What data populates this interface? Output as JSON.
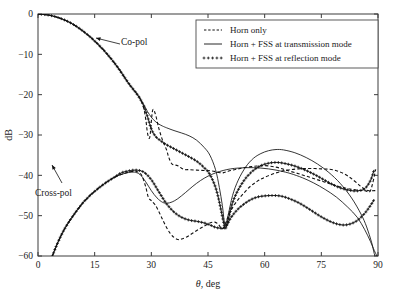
{
  "chart_data": {
    "type": "line",
    "title": "",
    "xlabel": "θ, deg",
    "ylabel": "dB",
    "xlim": [
      0,
      90
    ],
    "ylim": [
      -60,
      0
    ],
    "xticks": [
      0,
      15,
      30,
      45,
      60,
      75,
      90
    ],
    "yticks": [
      0,
      -10,
      -20,
      -30,
      -40,
      -50,
      -60
    ],
    "grid": false,
    "legend_position": "top-right",
    "legend": [
      {
        "label": "Horn only",
        "style": "dashed"
      },
      {
        "label": "Horn + FSS at transmission mode",
        "style": "solid"
      },
      {
        "label": "Horn + FSS at reflection mode",
        "style": "plus-markers"
      }
    ],
    "annotations": [
      {
        "text": "Co-pol",
        "x": 26,
        "y": -6
      },
      {
        "text": "Cross-pol",
        "x": 18,
        "y": -52
      }
    ],
    "series": [
      {
        "name": "Co-pol, Horn only",
        "style": "dashed",
        "x": [
          0,
          3,
          6,
          9,
          12,
          15,
          18,
          21,
          24,
          26,
          27,
          28,
          28.6,
          29,
          29.6,
          30.3,
          31,
          32,
          33,
          34,
          34.6,
          35.5,
          37,
          38.5,
          40,
          42,
          44,
          46,
          47.5,
          48.6,
          49.3,
          50,
          51,
          52.5,
          54,
          56,
          58,
          60,
          62,
          64,
          66,
          69,
          72,
          75,
          78,
          81,
          84,
          86.5,
          88,
          89.4
        ],
        "y": [
          0,
          -0.3,
          -1.1,
          -2.4,
          -4.3,
          -6.7,
          -9.6,
          -13.1,
          -17.2,
          -19.6,
          -20.9,
          -23.4,
          -26.6,
          -29.6,
          -30.5,
          -24.1,
          -24.6,
          -28.4,
          -31.4,
          -33.6,
          -35.5,
          -37.2,
          -37.6,
          -38.5,
          -38.6,
          -38.7,
          -38.8,
          -38.9,
          -39.2,
          -39.4,
          -39.3,
          -39.1,
          -38.8,
          -38.5,
          -38.2,
          -37.9,
          -37.7,
          -37.6,
          -37.8,
          -38.2,
          -38.8,
          -39.6,
          -40.5,
          -41.4,
          -42.3,
          -43.1,
          -43.6,
          -43.8,
          -43.8,
          -38.5
        ]
      },
      {
        "name": "Co-pol, Horn + FSS at transmission mode",
        "style": "solid",
        "x": [
          0,
          3,
          6,
          9,
          12,
          15,
          18,
          21,
          24,
          26,
          27,
          28,
          29,
          30,
          31,
          32,
          33,
          34,
          36,
          38,
          40,
          42,
          44,
          45.5,
          47,
          48,
          48.8,
          49.5,
          50.3,
          51.5,
          53,
          55,
          57,
          59,
          61,
          63,
          65,
          68,
          71,
          74,
          77,
          80,
          83,
          85.5,
          87,
          88.3,
          89.2,
          89.8
        ],
        "y": [
          0,
          -0.3,
          -1.1,
          -2.4,
          -4.3,
          -6.7,
          -9.6,
          -13.1,
          -17.2,
          -19.6,
          -21.0,
          -22.5,
          -24.2,
          -25.6,
          -26.6,
          -27.3,
          -27.8,
          -28.2,
          -28.9,
          -29.5,
          -30.2,
          -31.3,
          -33.1,
          -35.0,
          -38.6,
          -43.0,
          -47.5,
          -52.3,
          -50.0,
          -45.0,
          -41.2,
          -37.9,
          -35.8,
          -34.6,
          -33.9,
          -33.6,
          -33.7,
          -34.4,
          -35.6,
          -37.2,
          -39.3,
          -42.0,
          -45.6,
          -49.6,
          -52.8,
          -56.6,
          -60,
          -60
        ]
      },
      {
        "name": "Co-pol, Horn + FSS at reflection mode",
        "style": "plus-markers",
        "x": [
          0,
          3,
          6,
          9,
          12,
          15,
          18,
          21,
          24,
          26,
          27,
          28,
          29,
          30,
          31,
          32,
          33,
          34,
          36,
          38,
          40,
          42,
          44,
          45.5,
          47,
          48,
          48.8,
          49.6,
          50.4,
          51.5,
          53,
          55,
          57,
          59,
          61,
          63,
          65,
          68,
          71,
          74,
          77,
          80,
          83,
          85,
          86.5,
          88,
          89
        ],
        "y": [
          0,
          -0.3,
          -1.1,
          -2.4,
          -4.3,
          -6.7,
          -9.6,
          -13.1,
          -17.2,
          -19.6,
          -21.0,
          -22.8,
          -25.5,
          -28.5,
          -30.2,
          -31.1,
          -31.8,
          -32.4,
          -33.4,
          -34.4,
          -35.4,
          -36.5,
          -38.1,
          -39.8,
          -43.0,
          -46.6,
          -50.2,
          -53.1,
          -50.8,
          -46.8,
          -43.6,
          -40.7,
          -38.8,
          -37.6,
          -37.0,
          -36.8,
          -37.0,
          -37.7,
          -38.8,
          -40.2,
          -41.8,
          -43.1,
          -43.8,
          -43.8,
          -43.3,
          -41.3,
          -38.6
        ]
      },
      {
        "name": "Cross-pol, Horn only",
        "style": "dashed",
        "x": [
          3.8,
          5,
          6.5,
          8,
          10,
          12,
          14,
          16,
          18,
          20,
          22,
          24,
          25.5,
          26.5,
          27.5,
          28.5,
          29.2,
          30,
          31,
          32,
          33,
          34,
          35,
          36,
          37,
          38,
          39.5,
          41,
          42.5,
          44,
          45.5,
          46.8,
          47.8,
          48.6,
          49.2,
          50,
          51,
          52.5,
          54,
          56,
          58,
          60,
          63,
          66,
          69,
          72,
          75,
          78,
          81,
          83.5,
          85.5,
          87,
          88.2,
          89.3
        ],
        "y": [
          -60,
          -57.2,
          -54.2,
          -51.8,
          -49.1,
          -46.7,
          -44.8,
          -43.2,
          -41.8,
          -40.6,
          -39.8,
          -39.2,
          -39.0,
          -39.2,
          -40.1,
          -42.8,
          -45.4,
          -46.3,
          -47.3,
          -49.0,
          -51.0,
          -52.9,
          -54.4,
          -55.4,
          -55.9,
          -55.8,
          -55.2,
          -54.3,
          -53.4,
          -52.6,
          -51.8,
          -51.6,
          -52.2,
          -53.3,
          -52.8,
          -51.0,
          -48.8,
          -46.6,
          -44.9,
          -42.9,
          -41.5,
          -40.5,
          -39.4,
          -38.7,
          -38.4,
          -38.3,
          -38.4,
          -38.6,
          -39.6,
          -41.2,
          -42.8,
          -43.7,
          -43.8,
          -43.8
        ]
      },
      {
        "name": "Cross-pol, Horn + FSS at transmission mode",
        "style": "solid",
        "x": [
          3.8,
          5,
          6.5,
          8,
          10,
          12,
          14,
          16,
          18,
          20,
          22,
          24,
          25.5,
          27,
          28.5,
          30,
          31.5,
          33,
          34.2,
          35.5,
          37,
          39,
          41,
          43,
          45,
          47,
          49,
          51,
          53,
          55,
          57,
          59,
          61,
          63,
          65,
          67,
          70,
          73,
          76,
          79,
          82,
          84.5,
          86.5,
          88,
          89,
          89.7
        ],
        "y": [
          -60,
          -57.2,
          -54.2,
          -51.8,
          -49.1,
          -46.7,
          -44.8,
          -43.2,
          -41.8,
          -40.6,
          -39.8,
          -39.3,
          -39.2,
          -39.8,
          -41.6,
          -43.8,
          -45.6,
          -46.7,
          -46.9,
          -46.6,
          -45.8,
          -44.3,
          -42.7,
          -41.3,
          -40.2,
          -39.4,
          -38.8,
          -38.4,
          -38.2,
          -38.1,
          -38.1,
          -38.2,
          -38.4,
          -38.7,
          -39.1,
          -39.6,
          -40.6,
          -41.9,
          -43.5,
          -45.4,
          -47.9,
          -50.4,
          -53.5,
          -56.4,
          -58.6,
          -60
        ]
      },
      {
        "name": "Cross-pol, Horn + FSS at reflection mode",
        "style": "plus-markers",
        "x": [
          3.8,
          5,
          6.5,
          8,
          10,
          12,
          14,
          16,
          18,
          20,
          22,
          24,
          26,
          28,
          30,
          32,
          34,
          36,
          38,
          40,
          42,
          44,
          45.5,
          47,
          48.2,
          49.2,
          50,
          51,
          52.5,
          54,
          56,
          58,
          60,
          62,
          64,
          66,
          69,
          72,
          75,
          78,
          80.5,
          82.5,
          84.5,
          86.5,
          88,
          89
        ],
        "y": [
          -60,
          -57.2,
          -54.2,
          -51.8,
          -49.1,
          -46.7,
          -44.8,
          -43.2,
          -41.8,
          -40.6,
          -39.4,
          -38.9,
          -38.7,
          -39.2,
          -41.1,
          -44.1,
          -47.0,
          -49.1,
          -50.4,
          -51.1,
          -51.4,
          -51.8,
          -52.3,
          -52.9,
          -53.1,
          -53.1,
          -52.3,
          -50.6,
          -48.8,
          -47.5,
          -46.2,
          -45.4,
          -45.1,
          -45.0,
          -45.1,
          -45.6,
          -46.8,
          -48.5,
          -50.3,
          -51.7,
          -52.3,
          -52.1,
          -51.2,
          -49.4,
          -47.5,
          -46.0
        ]
      }
    ]
  }
}
